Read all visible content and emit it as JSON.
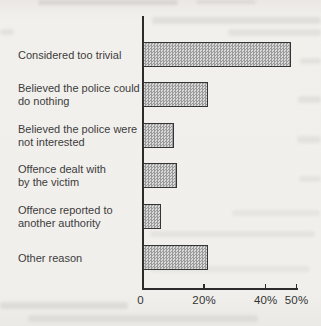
{
  "chart_data": {
    "type": "bar",
    "orientation": "horizontal",
    "title": "",
    "xlabel": "",
    "ylabel": "",
    "categories": [
      "Considered too trivial",
      "Believed the police could\ndo nothing",
      "Believed the police were\nnot interested",
      "Offence dealt with\nby the victim",
      "Offence reported to\nanother authority",
      "Other reason"
    ],
    "values": [
      48,
      21,
      10,
      11,
      6,
      21
    ],
    "unit": "%",
    "xlim": [
      0,
      50
    ],
    "x_ticks": [
      {
        "value": 0,
        "label": "0"
      },
      {
        "value": 20,
        "label": "20%"
      },
      {
        "value": 40,
        "label": "40%"
      },
      {
        "value": 50,
        "label": "50%"
      }
    ],
    "grid": false,
    "legend": null,
    "colors": {
      "bar_fill_average": "#bdbdbd",
      "bar_pattern": "checker-halftone",
      "bar_border": "#353535",
      "axis": "#2b2b2b",
      "text": "#3c3c3c",
      "paper": "#f1efec"
    }
  }
}
